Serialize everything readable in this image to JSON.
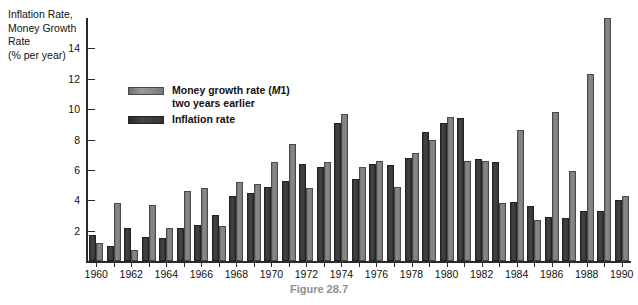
{
  "axis_title": {
    "line1": "Inflation Rate,",
    "line2": "Money Growth",
    "line3": "Rate",
    "line4": "(% per year)"
  },
  "legend": {
    "money_label_line1": "Money growth rate (M1)",
    "money_label_line2": "two years earlier",
    "inflation_label": "Inflation rate",
    "money_color": "#8b8b8b",
    "inflation_color": "#343434"
  },
  "caption": "Figure 28.7",
  "chart_data": {
    "type": "bar",
    "title": "Figure 28.7",
    "xlabel": "",
    "ylabel": "Inflation Rate, Money Growth Rate (% per year)",
    "ylim": [
      0,
      16
    ],
    "yticks": [
      2,
      4,
      6,
      8,
      10,
      12,
      14
    ],
    "xticks": [
      1960,
      1962,
      1964,
      1966,
      1968,
      1970,
      1972,
      1974,
      1976,
      1978,
      1980,
      1982,
      1984,
      1986,
      1988,
      1990
    ],
    "grid": false,
    "legend_position": "upper-left-inside",
    "categories": [
      1960,
      1961,
      1962,
      1963,
      1964,
      1965,
      1966,
      1967,
      1968,
      1969,
      1970,
      1971,
      1972,
      1973,
      1974,
      1975,
      1976,
      1977,
      1978,
      1979,
      1980,
      1981,
      1982,
      1983,
      1984,
      1985,
      1986,
      1987,
      1988,
      1989,
      1990
    ],
    "series": [
      {
        "name": "Inflation rate",
        "color": "#343434",
        "values": [
          1.7,
          1.0,
          2.2,
          1.6,
          1.5,
          2.2,
          2.4,
          3.0,
          4.3,
          4.5,
          4.9,
          5.3,
          6.4,
          6.2,
          9.1,
          5.4,
          6.4,
          6.3,
          6.8,
          8.5,
          9.1,
          9.4,
          6.7,
          6.5,
          3.9,
          3.6,
          2.9,
          2.8,
          3.3,
          3.3,
          4.0
        ]
      },
      {
        "name": "Money growth rate (M1) two years earlier",
        "color": "#8b8b8b",
        "values": [
          1.2,
          3.8,
          0.7,
          3.7,
          2.2,
          4.6,
          4.8,
          2.3,
          5.2,
          5.1,
          6.5,
          7.7,
          4.8,
          6.5,
          9.7,
          6.2,
          6.6,
          4.9,
          7.1,
          8.0,
          9.5,
          6.6,
          6.6,
          3.8,
          8.6,
          2.7,
          9.8,
          5.9,
          12.3,
          16.0,
          4.3
        ]
      }
    ]
  }
}
